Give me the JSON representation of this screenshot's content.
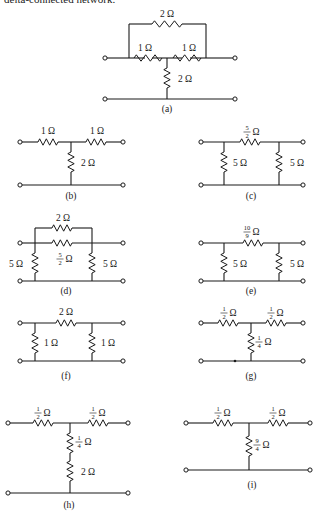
{
  "header": {
    "text": "delta-connected network."
  },
  "ohm": "Ω",
  "diagrams": [
    {
      "id": "a",
      "caption": "(a)",
      "captionPos": [
        167,
        112
      ],
      "terminals": [
        [
          105,
          58
        ],
        [
          235,
          58
        ],
        [
          105,
          99
        ],
        [
          235,
          99
        ]
      ],
      "wires": [
        [
          105,
          58,
          129,
          58
        ],
        [
          206,
          58,
          235,
          58
        ],
        [
          105,
          99,
          235,
          99
        ],
        [
          129,
          58,
          129,
          24
        ],
        [
          206,
          58,
          206,
          24
        ],
        [
          129,
          24,
          152,
          24
        ],
        [
          182,
          24,
          206,
          24
        ],
        [
          145,
          58,
          129,
          58
        ],
        [
          167,
          58,
          152,
          58
        ],
        [
          167,
          58,
          182,
          58
        ],
        [
          190,
          58,
          206,
          58
        ],
        [
          167,
          58,
          167,
          68
        ],
        [
          167,
          88,
          167,
          99
        ]
      ],
      "resistors": [
        {
          "o": "h",
          "x": 152,
          "y": 24,
          "len": 30,
          "label": "2 Ω",
          "lx": 167,
          "ly": 17
        },
        {
          "o": "h",
          "x": 134,
          "y": 58,
          "len": 28,
          "label": "1 Ω",
          "lx": 145,
          "ly": 51
        },
        {
          "o": "h",
          "x": 173,
          "y": 58,
          "len": 28,
          "label": "1 Ω",
          "lx": 189,
          "ly": 51
        },
        {
          "o": "v",
          "x": 167,
          "y": 68,
          "len": 20,
          "label": "2 Ω",
          "lx": 185,
          "ly": 82
        }
      ]
    },
    {
      "id": "b",
      "caption": "(b)",
      "captionPos": [
        71,
        199
      ],
      "terminals": [
        [
          20,
          142
        ],
        [
          123,
          142
        ],
        [
          20,
          185
        ],
        [
          123,
          185
        ]
      ],
      "wires": [
        [
          20,
          142,
          38,
          142
        ],
        [
          58,
          142,
          86,
          142
        ],
        [
          106,
          142,
          123,
          142
        ],
        [
          71,
          142,
          71,
          152
        ],
        [
          71,
          172,
          71,
          185
        ],
        [
          20,
          185,
          123,
          185
        ]
      ],
      "resistors": [
        {
          "o": "h",
          "x": 38,
          "y": 142,
          "len": 20,
          "label": "1 Ω",
          "lx": 48,
          "ly": 134
        },
        {
          "o": "h",
          "x": 86,
          "y": 142,
          "len": 20,
          "label": "1 Ω",
          "lx": 97,
          "ly": 134
        },
        {
          "o": "v",
          "x": 71,
          "y": 152,
          "len": 20,
          "label": "2 Ω",
          "lx": 88,
          "ly": 166
        }
      ]
    },
    {
      "id": "c",
      "caption": "(c)",
      "captionPos": [
        251,
        199
      ],
      "terminals": [
        [
          201,
          142
        ],
        [
          303,
          142
        ],
        [
          201,
          185
        ],
        [
          303,
          185
        ]
      ],
      "wires": [
        [
          201,
          142,
          240,
          142
        ],
        [
          260,
          142,
          303,
          142
        ],
        [
          224,
          142,
          224,
          152
        ],
        [
          224,
          172,
          224,
          185
        ],
        [
          279,
          142,
          279,
          152
        ],
        [
          279,
          172,
          279,
          185
        ],
        [
          201,
          185,
          303,
          185
        ]
      ],
      "resistors": [
        {
          "o": "h",
          "x": 240,
          "y": 142,
          "len": 20,
          "frac": [
            "5",
            "2"
          ],
          "lx": 247,
          "ly": 130
        },
        {
          "o": "v",
          "x": 224,
          "y": 152,
          "len": 20,
          "label": "5 Ω",
          "lx": 240,
          "ly": 166
        },
        {
          "o": "v",
          "x": 279,
          "y": 152,
          "len": 20,
          "label": "5 Ω",
          "lx": 297,
          "ly": 166
        }
      ]
    },
    {
      "id": "d",
      "caption": "(d)",
      "captionPos": [
        66,
        294
      ],
      "terminals": [
        [
          20,
          243
        ],
        [
          123,
          243
        ],
        [
          20,
          281
        ],
        [
          123,
          281
        ]
      ],
      "wires": [
        [
          35,
          243,
          35,
          228
        ],
        [
          92,
          243,
          92,
          228
        ],
        [
          35,
          228,
          52,
          228
        ],
        [
          72,
          228,
          92,
          228
        ],
        [
          20,
          243,
          52,
          243
        ],
        [
          72,
          243,
          123,
          243
        ],
        [
          35,
          243,
          35,
          253
        ],
        [
          35,
          273,
          35,
          281
        ],
        [
          92,
          243,
          92,
          253
        ],
        [
          92,
          273,
          92,
          281
        ],
        [
          20,
          281,
          123,
          281
        ]
      ],
      "resistors": [
        {
          "o": "h",
          "x": 52,
          "y": 228,
          "len": 20,
          "label": "2 Ω",
          "lx": 63,
          "ly": 221
        },
        {
          "o": "h",
          "x": 52,
          "y": 243,
          "len": 20,
          "frac": [
            "5",
            "2"
          ],
          "lx": 60,
          "ly": 257
        },
        {
          "o": "v",
          "x": 35,
          "y": 253,
          "len": 20,
          "label": "5 Ω",
          "lx": 16,
          "ly": 267
        },
        {
          "o": "v",
          "x": 92,
          "y": 253,
          "len": 20,
          "label": "5 Ω",
          "lx": 110,
          "ly": 267
        }
      ]
    },
    {
      "id": "e",
      "caption": "(e)",
      "captionPos": [
        251,
        294
      ],
      "terminals": [
        [
          201,
          243
        ],
        [
          303,
          243
        ],
        [
          201,
          281
        ],
        [
          303,
          281
        ]
      ],
      "wires": [
        [
          201,
          243,
          243,
          243
        ],
        [
          263,
          243,
          303,
          243
        ],
        [
          224,
          243,
          224,
          253
        ],
        [
          224,
          273,
          224,
          281
        ],
        [
          279,
          243,
          279,
          253
        ],
        [
          279,
          273,
          279,
          281
        ],
        [
          201,
          281,
          303,
          281
        ]
      ],
      "resistors": [
        {
          "o": "h",
          "x": 243,
          "y": 243,
          "len": 20,
          "frac": [
            "10",
            "9"
          ],
          "lx": 247,
          "ly": 230
        },
        {
          "o": "v",
          "x": 224,
          "y": 253,
          "len": 20,
          "label": "5 Ω",
          "lx": 240,
          "ly": 267
        },
        {
          "o": "v",
          "x": 279,
          "y": 253,
          "len": 20,
          "label": "5 Ω",
          "lx": 297,
          "ly": 267
        }
      ]
    },
    {
      "id": "f",
      "caption": "(f)",
      "captionPos": [
        66,
        379
      ],
      "terminals": [
        [
          20,
          323
        ],
        [
          123,
          323
        ],
        [
          20,
          361
        ],
        [
          123,
          361
        ]
      ],
      "wires": [
        [
          20,
          323,
          56,
          323
        ],
        [
          76,
          323,
          123,
          323
        ],
        [
          35,
          323,
          35,
          333
        ],
        [
          35,
          353,
          35,
          361
        ],
        [
          92,
          323,
          92,
          333
        ],
        [
          92,
          353,
          92,
          361
        ],
        [
          20,
          361,
          123,
          361
        ]
      ],
      "resistors": [
        {
          "o": "h",
          "x": 56,
          "y": 323,
          "len": 20,
          "label": "2 Ω",
          "lx": 66,
          "ly": 315
        },
        {
          "o": "v",
          "x": 35,
          "y": 333,
          "len": 20,
          "label": "1 Ω",
          "lx": 51,
          "ly": 346
        },
        {
          "o": "v",
          "x": 92,
          "y": 333,
          "len": 20,
          "label": "1 Ω",
          "lx": 108,
          "ly": 346
        }
      ]
    },
    {
      "id": "g",
      "caption": "(g)",
      "captionPos": [
        251,
        379
      ],
      "terminals": [
        [
          201,
          323
        ],
        [
          303,
          323
        ],
        [
          201,
          361
        ],
        [
          303,
          361
        ]
      ],
      "wires": [
        [
          201,
          323,
          218,
          323
        ],
        [
          238,
          323,
          266,
          323
        ],
        [
          286,
          323,
          303,
          323
        ],
        [
          251,
          323,
          251,
          333
        ],
        [
          251,
          353,
          251,
          361
        ],
        [
          201,
          361,
          303,
          361
        ]
      ],
      "dots": [
        [
          235,
          361
        ]
      ],
      "resistors": [
        {
          "o": "h",
          "x": 218,
          "y": 323,
          "len": 20,
          "frac": [
            "1",
            "2"
          ],
          "lx": 224,
          "ly": 311
        },
        {
          "o": "h",
          "x": 266,
          "y": 323,
          "len": 20,
          "frac": [
            "1",
            "2"
          ],
          "lx": 271,
          "ly": 311
        },
        {
          "o": "v",
          "x": 251,
          "y": 333,
          "len": 20,
          "frac": [
            "1",
            "4"
          ],
          "lx": 259,
          "ly": 340
        }
      ]
    },
    {
      "id": "h",
      "caption": "(h)",
      "captionPos": [
        69,
        508
      ],
      "terminals": [
        [
          8,
          423
        ],
        [
          128,
          423
        ],
        [
          8,
          493
        ],
        [
          128,
          493
        ]
      ],
      "wires": [
        [
          8,
          423,
          33,
          423
        ],
        [
          53,
          423,
          88,
          423
        ],
        [
          108,
          423,
          128,
          423
        ],
        [
          70,
          423,
          70,
          433
        ],
        [
          70,
          453,
          70,
          461
        ],
        [
          70,
          481,
          70,
          493
        ],
        [
          8,
          493,
          128,
          493
        ]
      ],
      "resistors": [
        {
          "o": "h",
          "x": 33,
          "y": 423,
          "len": 20,
          "frac": [
            "1",
            "2"
          ],
          "lx": 38,
          "ly": 411
        },
        {
          "o": "h",
          "x": 88,
          "y": 423,
          "len": 20,
          "frac": [
            "1",
            "2"
          ],
          "lx": 93,
          "ly": 411
        },
        {
          "o": "v",
          "x": 70,
          "y": 433,
          "len": 20,
          "frac": [
            "1",
            "4"
          ],
          "lx": 79,
          "ly": 440
        },
        {
          "o": "v",
          "x": 70,
          "y": 461,
          "len": 20,
          "label": "2 Ω",
          "lx": 88,
          "ly": 475
        }
      ]
    },
    {
      "id": "i",
      "caption": "(i)",
      "captionPos": [
        252,
        488
      ],
      "terminals": [
        [
          186,
          423
        ],
        [
          310,
          423
        ],
        [
          186,
          470
        ],
        [
          310,
          470
        ]
      ],
      "wires": [
        [
          186,
          423,
          213,
          423
        ],
        [
          233,
          423,
          268,
          423
        ],
        [
          288,
          423,
          310,
          423
        ],
        [
          249,
          423,
          249,
          436
        ],
        [
          249,
          456,
          249,
          470
        ],
        [
          186,
          470,
          310,
          470
        ]
      ],
      "resistors": [
        {
          "o": "h",
          "x": 213,
          "y": 423,
          "len": 20,
          "frac": [
            "1",
            "2"
          ],
          "lx": 218,
          "ly": 411
        },
        {
          "o": "h",
          "x": 268,
          "y": 423,
          "len": 20,
          "frac": [
            "1",
            "2"
          ],
          "lx": 273,
          "ly": 411
        },
        {
          "o": "v",
          "x": 249,
          "y": 436,
          "len": 20,
          "frac": [
            "9",
            "4"
          ],
          "lx": 257,
          "ly": 443
        }
      ]
    }
  ]
}
